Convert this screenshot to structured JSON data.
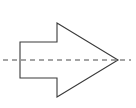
{
  "figure": {
    "title": "",
    "background_color": "#ffffff",
    "width": 136,
    "height": 108
  },
  "shapes": {
    "arrow": {
      "name": "block-arrow-right",
      "label": "",
      "direction": "right",
      "stroke_color": "#3a3a3a",
      "fill_color": "#ffffff",
      "stroke_width": 1.1,
      "points": "20,42 57,42 57,23 118,60 57,97 57,78 20,78",
      "vertices": [
        {
          "name": "tail-top-left",
          "x": 20,
          "y": 42
        },
        {
          "name": "tail-top-right",
          "x": 57,
          "y": 42
        },
        {
          "name": "head-top-vertex",
          "x": 57,
          "y": 23
        },
        {
          "name": "tip",
          "x": 118,
          "y": 60
        },
        {
          "name": "head-bottom-vertex",
          "x": 57,
          "y": 97
        },
        {
          "name": "tail-bottom-right",
          "x": 57,
          "y": 78
        },
        {
          "name": "tail-bottom-left",
          "x": 20,
          "y": 78
        }
      ]
    },
    "centerline": {
      "name": "dashed-axis-line",
      "label": "",
      "stroke_color": "#4a4a4a",
      "stroke_width": 1,
      "dash_pattern": "5,4",
      "x1": 3,
      "y1": 60,
      "x2": 131,
      "y2": 60
    }
  },
  "annotations": {
    "labels": []
  }
}
